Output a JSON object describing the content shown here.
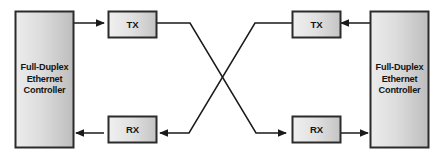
{
  "diagram": {
    "background_color": "#ffffff",
    "line_color": "#1a1a1a",
    "box_border_color": "#2b2b2b",
    "box_fill_light": "#ebebeb",
    "box_fill_dark": "#b9b9b9",
    "text_color": "#151515"
  },
  "nodes": {
    "left_controller": {
      "label_lines": [
        "Full-Duplex",
        "Ethernet",
        "Controller"
      ],
      "line1": "Full-Duplex",
      "line2": "Ethernet",
      "line3": "Controller"
    },
    "right_controller": {
      "label_lines": [
        "Full-Duplex",
        "Ethernet",
        "Controller"
      ],
      "line1": "Full-Duplex",
      "line2": "Ethernet",
      "line3": "Controller"
    },
    "left_tx": {
      "label": "TX"
    },
    "left_rx": {
      "label": "RX"
    },
    "right_tx": {
      "label": "TX"
    },
    "right_rx": {
      "label": "RX"
    }
  },
  "connections": [
    {
      "name": "left-controller-to-left-tx",
      "from": "left_controller",
      "to": "left_tx",
      "arrow": true
    },
    {
      "name": "left-tx-to-right-rx",
      "from": "left_tx",
      "to": "right_rx",
      "arrow": true,
      "crossover": true
    },
    {
      "name": "right-tx-to-left-rx",
      "from": "right_tx",
      "to": "left_rx",
      "arrow": true,
      "crossover": true
    },
    {
      "name": "left-rx-to-left-controller",
      "from": "left_rx",
      "to": "left_controller",
      "arrow": true
    },
    {
      "name": "right-controller-to-right-tx",
      "from": "right_controller",
      "to": "right_tx",
      "arrow": true
    },
    {
      "name": "right-rx-to-right-controller",
      "from": "right_rx",
      "to": "right_controller",
      "arrow": true
    }
  ]
}
